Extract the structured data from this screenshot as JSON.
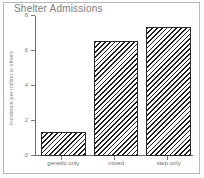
{
  "chart_data": {
    "type": "bar",
    "title": "Shelter Admissions",
    "xlabel": "",
    "ylabel": "Incidence per million w others",
    "categories": [
      "genetic only",
      "mixed",
      "step only"
    ],
    "values": [
      1.4,
      6.6,
      7.4
    ],
    "ylim": [
      0,
      8
    ],
    "yticks": [
      "0",
      "2",
      "4",
      "6",
      "8"
    ],
    "ytick_values": [
      0,
      2,
      4,
      6,
      8
    ],
    "grid": false,
    "legend": null,
    "bar_style": "diagonal-hatch",
    "colors": {
      "bar_edge": "#2b2b2b",
      "bar_hatch": "#1f1f1f",
      "bar_fill": "#ffffff",
      "axis": "#6f6f6f",
      "title_text": "#7c7c7c",
      "tick_text": "#7b7b7b",
      "frame": "#b9b9b9",
      "background": "#ffffff"
    }
  }
}
